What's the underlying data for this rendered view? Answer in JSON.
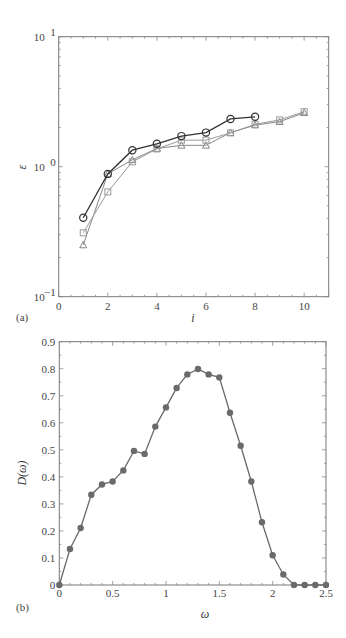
{
  "chart_data": [
    {
      "type": "line",
      "panel_label": "(a)",
      "title": "",
      "xlabel": "i",
      "ylabel": "ε",
      "yscale": "log",
      "xlim": [
        0,
        11
      ],
      "ylim": [
        0.1,
        10
      ],
      "x_ticks": [
        "0",
        "2",
        "4",
        "6",
        "8",
        "10"
      ],
      "y_ticks": [
        {
          "base": "10",
          "exp": "1"
        },
        {
          "base": "10",
          "exp": "0"
        },
        {
          "base": "10",
          "exp": "−1"
        }
      ],
      "grid": false,
      "legend": null,
      "series": [
        {
          "name": "circles",
          "marker": "circle",
          "color": "#333333",
          "x": [
            1,
            2,
            3,
            4,
            5,
            6,
            7,
            8
          ],
          "y": [
            0.405,
            0.88,
            1.34,
            1.5,
            1.72,
            1.83,
            2.33,
            2.42
          ]
        },
        {
          "name": "squares",
          "marker": "square",
          "color": "#9a9a9a",
          "x": [
            1,
            2,
            3,
            4,
            5,
            6,
            7,
            8,
            9,
            10
          ],
          "y": [
            0.31,
            0.64,
            1.09,
            1.37,
            1.6,
            1.6,
            1.82,
            2.12,
            2.29,
            2.65
          ]
        },
        {
          "name": "triangles",
          "marker": "triangle",
          "color": "#888888",
          "x": [
            1,
            2,
            3,
            4,
            5,
            6,
            7,
            8,
            9,
            10
          ],
          "y": [
            0.25,
            0.88,
            1.13,
            1.38,
            1.46,
            1.46,
            1.83,
            2.09,
            2.22,
            2.6
          ]
        }
      ]
    },
    {
      "type": "line",
      "panel_label": "(b)",
      "title": "",
      "xlabel": "ω",
      "ylabel": "D(ω)",
      "xlim": [
        0,
        2.5
      ],
      "ylim": [
        0,
        0.9
      ],
      "x_ticks": [
        "0",
        "0.5",
        "1",
        "1.5",
        "2",
        "2.5"
      ],
      "y_ticks": [
        "0",
        "0.1",
        "0.2",
        "0.3",
        "0.4",
        "0.5",
        "0.6",
        "0.7",
        "0.8",
        "0.9"
      ],
      "grid": false,
      "legend": null,
      "series": [
        {
          "name": "D(ω)",
          "marker": "filled-circle",
          "color": "#6a6a6a",
          "x": [
            0,
            0.1,
            0.2,
            0.3,
            0.4,
            0.5,
            0.6,
            0.7,
            0.8,
            0.9,
            1.0,
            1.1,
            1.2,
            1.3,
            1.4,
            1.5,
            1.6,
            1.7,
            1.8,
            1.9,
            2.0,
            2.1,
            2.2,
            2.3,
            2.4,
            2.5
          ],
          "y": [
            0,
            0.133,
            0.211,
            0.334,
            0.372,
            0.383,
            0.424,
            0.496,
            0.485,
            0.586,
            0.657,
            0.729,
            0.779,
            0.799,
            0.779,
            0.768,
            0.637,
            0.515,
            0.383,
            0.232,
            0.11,
            0.039,
            0,
            0,
            0,
            0
          ]
        }
      ]
    }
  ]
}
